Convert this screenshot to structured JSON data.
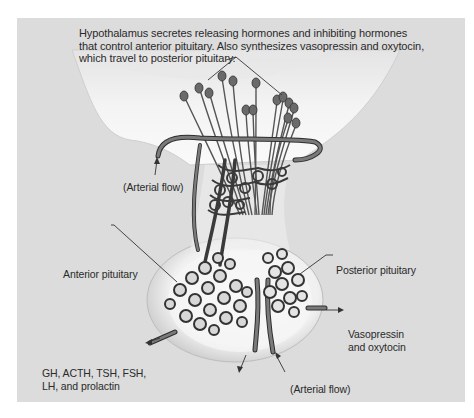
{
  "figure": {
    "title_note": {
      "lines": [
        "Hypothalamus secretes releasing hormones and inhibiting hormones",
        "that control anterior pituitary.  Also synthesizes vasopressin and oxytocin,",
        "which travel to posterior pituitary."
      ]
    },
    "labels": {
      "arterial_flow_top": "(Arterial flow)",
      "anterior_pituitary": "Anterior pituitary",
      "posterior_pituitary": "Posterior pituitary",
      "vasopressin_oxytocin": [
        "Vasopressin",
        "and oxytocin"
      ],
      "anterior_hormones": [
        "GH, ACTH, TSH, FSH,",
        "LH, and prolactin"
      ],
      "arterial_flow_bottom": "(Arterial flow)"
    },
    "colors": {
      "panel_background": "#dcdcdc",
      "tissue_white": "#f6f6f6",
      "vessel": "#5a5a5a",
      "vessel_outline": "#2e2e2e",
      "text": "#2a2a2a"
    }
  }
}
